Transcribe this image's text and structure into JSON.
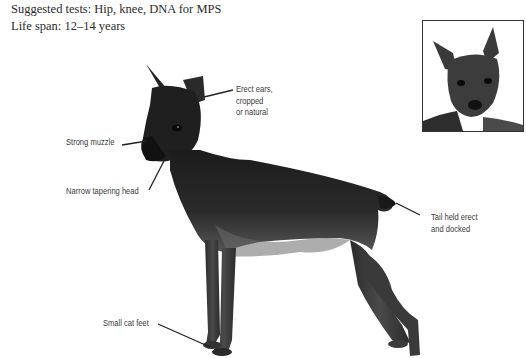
{
  "header": {
    "suggested_tests": "Suggested tests: Hip, knee, DNA for MPS",
    "life_span": "Life span: 12–14 years"
  },
  "callouts": {
    "ears": "Erect ears,\ncropped\nor natural",
    "muzzle": "Strong muzzle",
    "head": "Narrow tapering head",
    "tail": "Tail held erect\nand docked",
    "feet": "Small cat feet"
  },
  "images": {
    "main_photo": "Miniature Pinscher, standing side profile",
    "inset_photo": "Miniature Pinscher, head close-up"
  }
}
